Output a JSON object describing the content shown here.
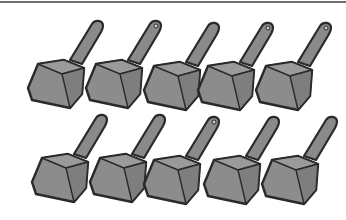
{
  "illustration": {
    "subject": "scoop",
    "count": 10,
    "rows": 2,
    "per_row": 5,
    "colors": {
      "fill": "#8c8c8c",
      "outline": "#2a2a2a",
      "border": "#6f6f6f",
      "background": "#ffffff"
    }
  }
}
